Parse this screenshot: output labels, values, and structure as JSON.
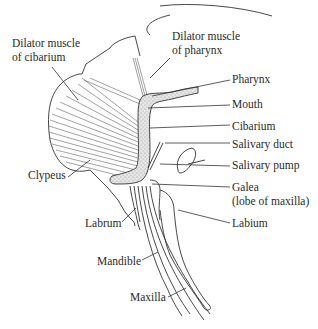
{
  "diagram": {
    "type": "anatomical-illustration",
    "labels": [
      {
        "id": "dilator-cibarium-1",
        "text": "Dilator muscle",
        "x": 12,
        "y": 47
      },
      {
        "id": "dilator-cibarium-2",
        "text": "of cibarium",
        "x": 12,
        "y": 61
      },
      {
        "id": "dilator-pharynx-1",
        "text": "Dilator muscle",
        "x": 172,
        "y": 40
      },
      {
        "id": "dilator-pharynx-2",
        "text": "of pharynx",
        "x": 172,
        "y": 54
      },
      {
        "id": "pharynx",
        "text": "Pharynx",
        "x": 232,
        "y": 83
      },
      {
        "id": "mouth",
        "text": "Mouth",
        "x": 232,
        "y": 108
      },
      {
        "id": "cibarium",
        "text": "Cibarium",
        "x": 232,
        "y": 130
      },
      {
        "id": "salivary-duct",
        "text": "Salivary duct",
        "x": 232,
        "y": 148
      },
      {
        "id": "salivary-pump",
        "text": "Salivary pump",
        "x": 232,
        "y": 169
      },
      {
        "id": "galea-1",
        "text": "Galea",
        "x": 232,
        "y": 191
      },
      {
        "id": "galea-2",
        "text": "(lobe of maxilla)",
        "x": 232,
        "y": 205
      },
      {
        "id": "labium",
        "text": "Labium",
        "x": 232,
        "y": 227
      },
      {
        "id": "clypeus",
        "text": "Clypeus",
        "x": 28,
        "y": 179
      },
      {
        "id": "labrum",
        "text": "Labrum",
        "x": 85,
        "y": 227
      },
      {
        "id": "mandible",
        "text": "Mandible",
        "x": 97,
        "y": 265
      },
      {
        "id": "maxilla",
        "text": "Maxilla",
        "x": 130,
        "y": 301
      }
    ]
  }
}
